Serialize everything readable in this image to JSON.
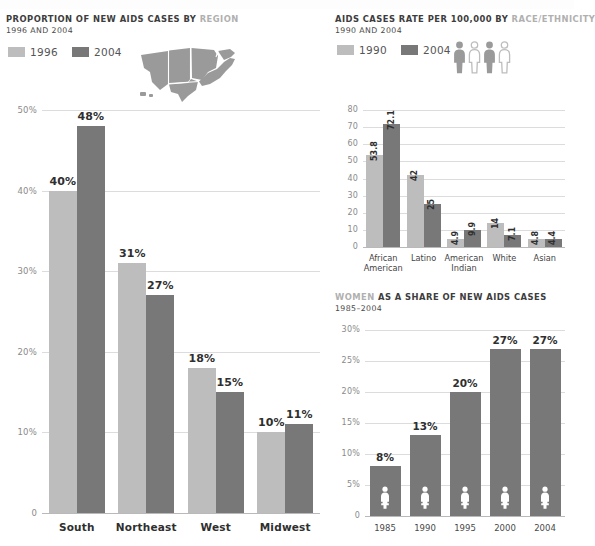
{
  "colors": {
    "light": "#bdbdbd",
    "dark": "#787878",
    "grid": "#dcdcdc",
    "axis": "#b9b9b9",
    "title_dark": "#3d3d3d",
    "title_muted": "#b0b0b0",
    "tick": "#8a8a8a"
  },
  "panel_region": {
    "title_main": "PROPORTION OF NEW AIDS CASES BY ",
    "title_muted": "REGION",
    "subtitle": "1996 AND 2004",
    "legend": [
      {
        "label": "1996",
        "color": "#bdbdbd",
        "icon": "legend-swatch"
      },
      {
        "label": "2004",
        "color": "#787878",
        "icon": "legend-swatch"
      }
    ],
    "map_icon": "us-map-regions-icon"
  },
  "panel_race": {
    "title_main": "AIDS CASES RATE PER 100,000 BY ",
    "title_muted": "RACE/ETHNICITY",
    "subtitle": "1990 AND 2004",
    "legend": [
      {
        "label": "1990",
        "color": "#bdbdbd",
        "icon": "legend-swatch"
      },
      {
        "label": "2004",
        "color": "#787878",
        "icon": "legend-swatch"
      }
    ],
    "people_icon": "people-group-icon"
  },
  "panel_women": {
    "title_muted": "WOMEN",
    "title_main": " AS A SHARE OF NEW AIDS CASES",
    "subtitle": "1985–2004",
    "bar_icon": "woman-figure-icon"
  },
  "chart_data": [
    {
      "id": "chart-region",
      "type": "bar",
      "title": "PROPORTION OF NEW AIDS CASES BY REGION",
      "subtitle": "1996 AND 2004",
      "categories": [
        "South",
        "Northeast",
        "West",
        "Midwest"
      ],
      "series": [
        {
          "name": "1996",
          "color": "#bdbdbd",
          "values": [
            40,
            31,
            18,
            10
          ],
          "labels": [
            "40%",
            "31%",
            "18%",
            "10%"
          ]
        },
        {
          "name": "2004",
          "color": "#787878",
          "values": [
            48,
            27,
            15,
            11
          ],
          "labels": [
            "48%",
            "27%",
            "15%",
            "11%"
          ]
        }
      ],
      "xlabel": "",
      "ylabel": "",
      "ylim": [
        0,
        50
      ],
      "yticks": [
        0,
        10,
        20,
        30,
        40,
        50
      ],
      "ytick_labels": [
        "0",
        "10%",
        "20%",
        "30%",
        "40%",
        "50%"
      ],
      "grid": true,
      "legend_position": "top-left"
    },
    {
      "id": "chart-race",
      "type": "bar",
      "title": "AIDS CASES RATE PER 100,000 BY RACE/ETHNICITY",
      "subtitle": "1990 AND 2004",
      "categories": [
        "African American",
        "Latino",
        "American Indian",
        "White",
        "Asian"
      ],
      "category_lines": [
        [
          "African",
          "American"
        ],
        [
          "Latino",
          ""
        ],
        [
          "American",
          "Indian"
        ],
        [
          "White",
          ""
        ],
        [
          "Asian",
          ""
        ]
      ],
      "series": [
        {
          "name": "1990",
          "color": "#bdbdbd",
          "values": [
            53.8,
            42,
            4.9,
            14,
            4.8
          ],
          "labels": [
            "53.8",
            "42",
            "4.9",
            "14",
            "4.8"
          ]
        },
        {
          "name": "2004",
          "color": "#787878",
          "values": [
            72.1,
            25,
            9.9,
            7.1,
            4.4
          ],
          "labels": [
            "72.1",
            "25",
            "9.9",
            "7.1",
            "4.4"
          ]
        }
      ],
      "xlabel": "",
      "ylabel": "",
      "ylim": [
        0,
        80
      ],
      "yticks": [
        0,
        10,
        20,
        30,
        40,
        50,
        60,
        70,
        80
      ],
      "ytick_labels": [
        "0",
        "10",
        "20",
        "30",
        "40",
        "50",
        "60",
        "70",
        "80"
      ],
      "grid": true,
      "legend_position": "top-left"
    },
    {
      "id": "chart-women",
      "type": "bar",
      "title": "WOMEN AS A SHARE OF NEW AIDS CASES",
      "subtitle": "1985–2004",
      "categories": [
        "1985",
        "1990",
        "1995",
        "2000",
        "2004"
      ],
      "series": [
        {
          "name": "share",
          "color": "#787878",
          "values": [
            8,
            13,
            20,
            27,
            27
          ],
          "labels": [
            "8%",
            "13%",
            "20%",
            "27%",
            "27%"
          ]
        }
      ],
      "xlabel": "",
      "ylabel": "",
      "ylim": [
        0,
        30
      ],
      "yticks": [
        0,
        5,
        10,
        15,
        20,
        25,
        30
      ],
      "ytick_labels": [
        "0",
        "5%",
        "10%",
        "15%",
        "20%",
        "25%",
        "30%"
      ],
      "grid": true,
      "legend_position": "none"
    }
  ]
}
